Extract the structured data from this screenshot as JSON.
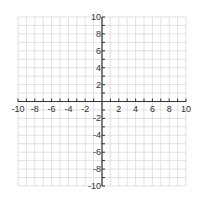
{
  "chart_data": {
    "type": "scatter",
    "title": "",
    "xlabel": "",
    "ylabel": "",
    "xlim": [
      -10,
      10
    ],
    "ylim": [
      -10,
      10
    ],
    "grid": true,
    "grid_step": 1,
    "x_ticks": [
      -10,
      -8,
      -6,
      -4,
      -2,
      2,
      4,
      6,
      8,
      10
    ],
    "y_ticks": [
      10,
      8,
      6,
      4,
      2,
      -2,
      -4,
      -6,
      -8,
      -10
    ],
    "x_tick_labels": [
      "-10",
      "-8",
      "-6",
      "-4",
      "-2",
      "2",
      "4",
      "6",
      "8",
      "10"
    ],
    "y_tick_labels": [
      "10",
      "8",
      "6",
      "4",
      "2",
      "-2",
      "-4",
      "-6",
      "-8",
      "-10"
    ],
    "series": [],
    "legend": null
  },
  "style": {
    "grid_color": "#d9d9d9",
    "axis_color": "#333333",
    "label_color": "#333333",
    "background": "#ffffff"
  }
}
